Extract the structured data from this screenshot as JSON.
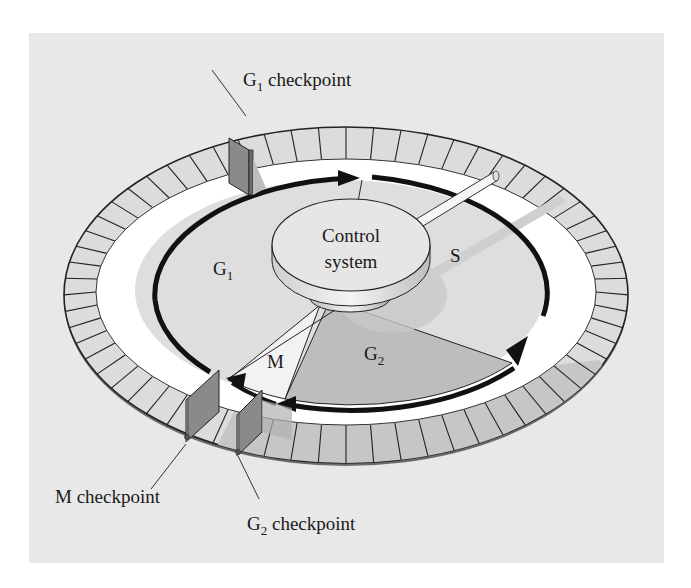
{
  "figure": {
    "phases": {
      "g1": {
        "main": "G",
        "sub": "1"
      },
      "s": "S",
      "g2": {
        "main": "G",
        "sub": "2"
      },
      "m": "M"
    },
    "control_system": {
      "line1": "Control",
      "line2": "system"
    },
    "checkpoints": {
      "g1": {
        "main": "G",
        "sub": "1",
        "suffix": " checkpoint"
      },
      "m": {
        "label": "M checkpoint"
      },
      "g2": {
        "main": "G",
        "sub": "2",
        "suffix": " checkpoint"
      }
    },
    "colors": {
      "background_panel": "#e8e8e8",
      "ring_tiles": "#dcdcdc",
      "ring_tiles_shaded": "#c4c4c4",
      "white_band": "#ffffff",
      "inner_disk": "#dedede",
      "g2_wedge": "#bdbdbd",
      "arrow": "#111111",
      "checkpoint_gate": "#8a8a8a",
      "control_disk": "#e4e4e4"
    }
  }
}
